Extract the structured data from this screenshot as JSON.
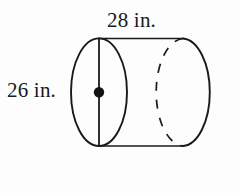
{
  "figure": {
    "name": "cylinder-diagram",
    "shape": "cylinder",
    "stroke_color": "#1a1a1a",
    "background_color": "#fdfdfd",
    "labels": {
      "length": "28 in.",
      "diameter": "26 in."
    },
    "measurements": [
      {
        "name": "length",
        "value": 28,
        "unit": "in.",
        "text": "28 in.",
        "position": "top"
      },
      {
        "name": "diameter",
        "value": 26,
        "unit": "in.",
        "text": "26 in.",
        "position": "left"
      }
    ],
    "parts": {
      "near-face-ellipse": "solid ellipse at left end",
      "far-face-arc": "dashed arc showing hidden back circular edge",
      "right-end-arc": "solid arc forming far right end of cylinder",
      "top-edge": "solid line joining top of near ellipse to top of far arc",
      "bottom-edge": "solid line joining bottom of near ellipse to bottom of far arc",
      "diameter-line": "vertical segment across near face",
      "center-dot": "filled dot marking center of near face"
    }
  }
}
